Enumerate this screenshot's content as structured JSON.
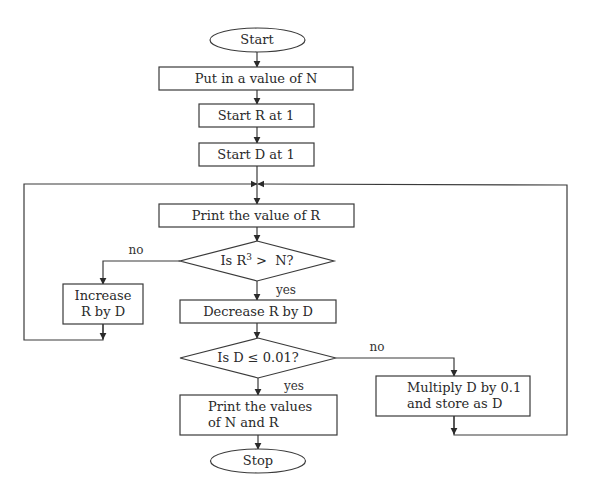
{
  "flowchart": {
    "title": "",
    "nodes": {
      "start": {
        "type": "terminator",
        "label": "Start"
      },
      "input_n": {
        "type": "process",
        "label": "Put in a value of N"
      },
      "init_r": {
        "type": "process",
        "label": "Start R at 1"
      },
      "init_d": {
        "type": "process",
        "label": "Start D at 1"
      },
      "print_r": {
        "type": "process",
        "label": "Print the value of R"
      },
      "check_cube": {
        "type": "decision",
        "label_prefix": "Is R",
        "label_sup": "3",
        "label_suffix": " >  N?"
      },
      "increase_r": {
        "type": "process",
        "label_line1": "Increase",
        "label_line2": "R by D"
      },
      "decrease_r": {
        "type": "process",
        "label": "Decrease R by D"
      },
      "check_d": {
        "type": "decision",
        "label": "Is D ≤ 0.01?"
      },
      "multiply_d": {
        "type": "process",
        "label_line1": "Multiply D by 0.1",
        "label_line2": "and store as D"
      },
      "print_nr": {
        "type": "process",
        "label_line1": "Print the values",
        "label_line2": "of N and R"
      },
      "stop": {
        "type": "terminator",
        "label": "Stop"
      }
    },
    "edges": {
      "cube_no": {
        "from": "check_cube",
        "to": "increase_r",
        "label": "no"
      },
      "cube_yes": {
        "from": "check_cube",
        "to": "decrease_r",
        "label": "yes"
      },
      "d_no": {
        "from": "check_d",
        "to": "multiply_d",
        "label": "no"
      },
      "d_yes": {
        "from": "check_d",
        "to": "print_nr",
        "label": "yes"
      },
      "increase_loop": {
        "from": "increase_r",
        "to": "print_r",
        "label": ""
      },
      "multiply_loop": {
        "from": "multiply_d",
        "to": "print_r",
        "label": ""
      }
    },
    "colors": {
      "stroke": "#3a3a3a",
      "text": "#2a2a2a",
      "background": "#ffffff"
    }
  }
}
